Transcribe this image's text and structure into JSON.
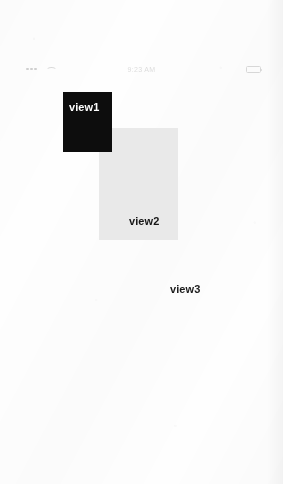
{
  "status_bar": {
    "signal_icon": "signal-dots-icon",
    "wifi_icon": "wifi-icon",
    "carrier": "",
    "time": "9:23 AM",
    "battery_percent": "",
    "battery_icon": "battery-icon"
  },
  "canvas": {
    "background_color": "#ffffff",
    "views": [
      {
        "name": "view1",
        "label": "view1",
        "fill_color": "#0d0d0d",
        "text_color": "#fdfdfd",
        "x": 63,
        "y": 92,
        "width": 49,
        "height": 60
      },
      {
        "name": "view2",
        "label": "view2",
        "fill_color": "#e9e9e9",
        "text_color": "#161616",
        "x": 99,
        "y": 128,
        "width": 79,
        "height": 112
      },
      {
        "name": "view3",
        "label": "view3",
        "fill_color": "transparent",
        "text_color": "#1b1b1b",
        "x": 170,
        "y": 283
      }
    ]
  }
}
